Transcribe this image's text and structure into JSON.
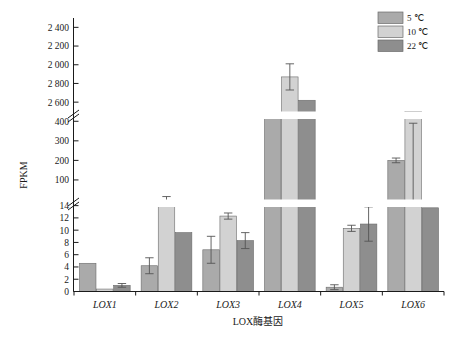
{
  "chart_data": {
    "type": "bar",
    "title": "",
    "xlabel": "LOX酶基因",
    "ylabel": "FPKM",
    "categories": [
      "LOX1",
      "LOX2",
      "LOX3",
      "LOX4",
      "LOX5",
      "LOX6"
    ],
    "legend_position": "top-right",
    "grid": false,
    "broken_axis": true,
    "axis_segments": [
      {
        "name": "low",
        "min": 0,
        "max": 15,
        "ticks": [
          0,
          2,
          4,
          6,
          8,
          10,
          12,
          14
        ]
      },
      {
        "name": "mid",
        "min": 0,
        "max": 450,
        "ticks": [
          100,
          200,
          300,
          400
        ]
      },
      {
        "name": "high",
        "min": 1500,
        "max": 2500,
        "ticks": [
          1600,
          1800,
          2000,
          2200,
          2400
        ]
      }
    ],
    "tick_labels": [
      "0",
      "2",
      "4",
      "6",
      "8",
      "10",
      "12",
      "14",
      "100",
      "200",
      "300",
      "400",
      "1 600",
      "1 800",
      "2 000",
      "2 200",
      "2 400"
    ],
    "series": [
      {
        "name": "5 ℃",
        "color": "#aaaaaa",
        "values": [
          4.6,
          4.2,
          6.8,
          430,
          0.7,
          200
        ],
        "errors": [
          0,
          1.3,
          2.2,
          12,
          0.4,
          12
        ]
      },
      {
        "name": "10 ℃",
        "color": "#d2d2d2",
        "values": [
          0.4,
          14.6,
          12.3,
          1870,
          10.3,
          450
        ],
        "errors": [
          0,
          0.5,
          0.5,
          140,
          0.5,
          60
        ]
      },
      {
        "name": "22 ℃",
        "color": "#8e8e8e",
        "values": [
          1.0,
          9.6,
          8.3,
          1620,
          11.0,
          470
        ],
        "errors": [
          0.3,
          0,
          1.3,
          0,
          2.8,
          0
        ]
      }
    ]
  },
  "legend": {
    "items": [
      {
        "label": "5 ℃",
        "color": "#aaaaaa"
      },
      {
        "label": "10 ℃",
        "color": "#d2d2d2"
      },
      {
        "label": "22 ℃",
        "color": "#8e8e8e"
      }
    ]
  },
  "axes": {
    "y_title": "FPKM",
    "x_title": "LOX酶基因"
  }
}
